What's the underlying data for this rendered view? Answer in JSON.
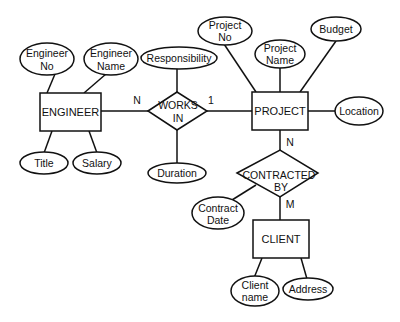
{
  "diagram": {
    "type": "ER diagram",
    "entities": [
      {
        "id": "engineer",
        "label": "ENGINEER"
      },
      {
        "id": "project",
        "label": "PROJECT"
      },
      {
        "id": "client",
        "label": "CLIENT"
      }
    ],
    "relationships": [
      {
        "id": "works_in",
        "line1": "WORKS",
        "line2": "IN",
        "between": [
          "ENGINEER",
          "PROJECT"
        ],
        "cardinality_left": "N",
        "cardinality_right": "1"
      },
      {
        "id": "contracted_by",
        "line1": "CONTRACTED",
        "line2": "BY",
        "between": [
          "PROJECT",
          "CLIENT"
        ],
        "cardinality_top": "N",
        "cardinality_bottom": "M"
      }
    ],
    "attributes": {
      "engineer_no": {
        "line1": "Engineer",
        "line2": "No"
      },
      "engineer_name": {
        "line1": "Engineer",
        "line2": "Name"
      },
      "title": {
        "line1": "Title"
      },
      "salary": {
        "line1": "Salary"
      },
      "responsibility": {
        "line1": "Responsibility"
      },
      "duration": {
        "line1": "Duration"
      },
      "project_no": {
        "line1": "Project",
        "line2": "No"
      },
      "project_name": {
        "line1": "Project",
        "line2": "Name"
      },
      "budget": {
        "line1": "Budget"
      },
      "location": {
        "line1": "Location"
      },
      "contract_date": {
        "line1": "Contract",
        "line2": "Date"
      },
      "client_name": {
        "line1": "Client",
        "line2": "name"
      },
      "address": {
        "line1": "Address"
      }
    }
  }
}
